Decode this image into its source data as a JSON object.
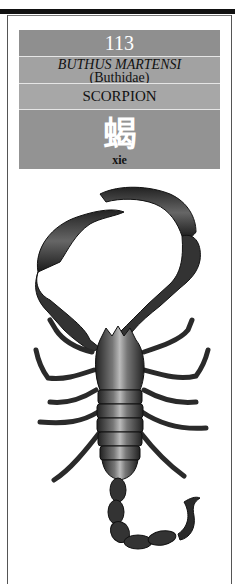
{
  "entry": {
    "number": "113",
    "latin_name": "BUTHUS MARTENSI",
    "family": "(Buthidae)",
    "common_name": "SCORPION",
    "chinese_character": "蝎",
    "pinyin": "xie"
  },
  "illustration": {
    "subject": "scorpion-illustration",
    "style": "black-and-white engraving"
  },
  "colors": {
    "band_number": "#8f8f8f",
    "band_name": "#a2a2a2",
    "band_common": "#a7a7a7",
    "band_char": "#939393",
    "rule": "#111111"
  }
}
